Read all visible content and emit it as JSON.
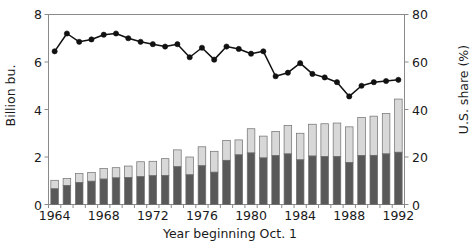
{
  "chart_data": {
    "type": "bar",
    "title": "",
    "subtitle": "",
    "xlabel": "Year beginning Oct. 1",
    "ylabel": "Billion bu.",
    "y2label": "U.S. share (%)",
    "grid": false,
    "legend_position": "none",
    "ylim": [
      0,
      8
    ],
    "y2lim": [
      0,
      80
    ],
    "yticks": [
      0,
      2,
      4,
      6,
      8
    ],
    "y2ticks": [
      0,
      20,
      40,
      60,
      80
    ],
    "xticks": [
      1964,
      1968,
      1972,
      1976,
      1980,
      1984,
      1988,
      1992
    ],
    "categories": [
      1964,
      1965,
      1966,
      1967,
      1968,
      1969,
      1970,
      1971,
      1972,
      1973,
      1974,
      1975,
      1976,
      1977,
      1978,
      1979,
      1980,
      1981,
      1982,
      1983,
      1984,
      1985,
      1986,
      1987,
      1988,
      1989,
      1990,
      1991,
      1992
    ],
    "series": [
      {
        "name": "U.S. exports (stacked lower, dark)",
        "color": "#595959",
        "type": "bar-stack-lower",
        "values": [
          0.66,
          0.8,
          0.92,
          0.98,
          1.07,
          1.12,
          1.13,
          1.17,
          1.21,
          1.22,
          1.59,
          1.25,
          1.63,
          1.36,
          1.86,
          2.09,
          2.17,
          1.96,
          2.06,
          2.13,
          1.88,
          2.04,
          2.02,
          2.02,
          1.77,
          2.06,
          2.07,
          2.13,
          2.2
        ]
      },
      {
        "name": "Other exporters (stacked upper, light)",
        "color": "#d8d8d8",
        "type": "bar-stack-upper",
        "values": [
          0.36,
          0.3,
          0.38,
          0.37,
          0.44,
          0.43,
          0.49,
          0.63,
          0.61,
          0.71,
          0.71,
          0.75,
          0.8,
          0.88,
          0.84,
          0.63,
          1.02,
          0.92,
          1.02,
          1.2,
          1.12,
          1.34,
          1.38,
          1.41,
          1.5,
          1.61,
          1.65,
          1.7,
          2.24
        ]
      },
      {
        "name": "U.S. share (%)",
        "color": "#111111",
        "type": "line",
        "axis": "right",
        "values": [
          64.5,
          72.0,
          68.5,
          69.5,
          71.5,
          72.0,
          70.0,
          68.5,
          67.5,
          66.5,
          67.5,
          62.0,
          66.0,
          61.0,
          66.5,
          65.5,
          63.5,
          64.5,
          54.0,
          55.5,
          59.5,
          55.0,
          53.5,
          51.5,
          45.5,
          50.0,
          51.5,
          52.0,
          52.5
        ]
      }
    ]
  },
  "axes": {
    "left_title": "Billion bu.",
    "right_title": "U.S. share (%)",
    "x_title": "Year beginning Oct. 1",
    "left_ticks": [
      "0",
      "2",
      "4",
      "6",
      "8"
    ],
    "right_ticks": [
      "0",
      "20",
      "40",
      "60",
      "80"
    ],
    "x_ticks": [
      "1964",
      "1968",
      "1972",
      "1976",
      "1980",
      "1984",
      "1988",
      "1992"
    ]
  },
  "colors": {
    "bar_lower": "#595959",
    "bar_upper": "#d8d8d8",
    "bar_edge": "#6f6f6f",
    "line": "#111111",
    "frame": "#8a8a8a",
    "text": "#1a1a1a",
    "background": "#ffffff"
  }
}
